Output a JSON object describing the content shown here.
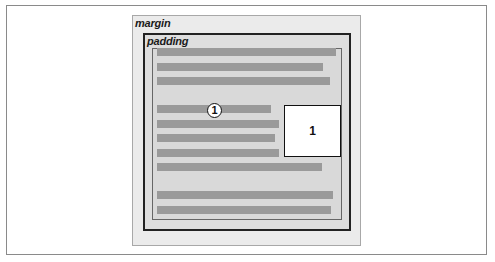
{
  "diagram": {
    "labels": {
      "margin": "margin",
      "padding": "padding"
    },
    "floated_element": {
      "label": "1"
    },
    "callout": {
      "label": "1"
    },
    "text_lines": [
      {
        "left": 157,
        "top": 48,
        "right": 336
      },
      {
        "left": 157,
        "top": 63,
        "right": 323
      },
      {
        "left": 157,
        "top": 77,
        "right": 330
      },
      {
        "left": 157,
        "top": 105,
        "right": 271
      },
      {
        "left": 157,
        "top": 120,
        "right": 279
      },
      {
        "left": 157,
        "top": 134,
        "right": 275
      },
      {
        "left": 157,
        "top": 149,
        "right": 279
      },
      {
        "left": 157,
        "top": 163,
        "right": 322
      },
      {
        "left": 157,
        "top": 191,
        "right": 333
      },
      {
        "left": 157,
        "top": 206,
        "right": 331
      }
    ],
    "colors": {
      "margin_area": "#ebebeb",
      "padding_area": "#dedede",
      "content_area": "#d9d9d9",
      "text_line": "#9a9a9a",
      "border": "#222222",
      "float_fill": "#ffffff"
    }
  }
}
